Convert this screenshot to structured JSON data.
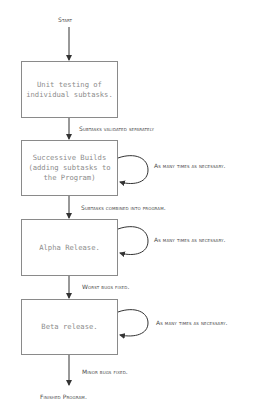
{
  "diagram": {
    "type": "flowchart",
    "start_label": "Start",
    "end_label": "Finished Program.",
    "colors": {
      "box_border": "#8a8a8a",
      "box_text": "#8c8c8c",
      "label_text": "#4a4a4a",
      "arrow": "#333333"
    },
    "steps": [
      {
        "id": "unit-testing",
        "text": "Unit testing of\nindividual subtasks.",
        "transition_label": "Subtasks validated separately"
      },
      {
        "id": "successive-builds",
        "text": "Successive Builds\n(adding subtasks to\nthe Program)",
        "loop_label": "As many times as necessary.",
        "transition_label": "Subtasks combined into program."
      },
      {
        "id": "alpha-release",
        "text": "Alpha Release.",
        "loop_label": "As many times as necessary.",
        "transition_label": "Worst bugs fixed."
      },
      {
        "id": "beta-release",
        "text": "Beta release.",
        "loop_label": "As many times as necessary.",
        "transition_label": "Minor bugs fixed."
      }
    ]
  }
}
